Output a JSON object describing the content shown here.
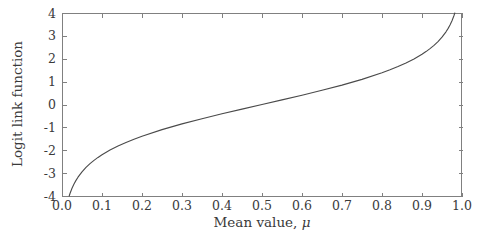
{
  "chart_data": {
    "type": "line",
    "title": "",
    "subtitle": "",
    "xlabel": "Mean value, μ",
    "xlabel_text": "Mean value,",
    "xlabel_symbol": "μ",
    "ylabel": "Logit link function",
    "xlim": [
      0.0,
      1.0
    ],
    "ylim": [
      -4,
      4
    ],
    "grid": false,
    "legend": null,
    "legend_position": "none",
    "annotations": [],
    "line_color": "#4a4a4a",
    "frame_color": "#808080",
    "background_color": "#ffffff",
    "xticks": [
      0.0,
      0.1,
      0.2,
      0.3,
      0.4,
      0.5,
      0.6,
      0.7,
      0.8,
      0.9,
      1.0
    ],
    "xticklabels": [
      "0.0",
      "0.1",
      "0.2",
      "0.3",
      "0.4",
      "0.5",
      "0.6",
      "0.7",
      "0.8",
      "0.9",
      "1.0"
    ],
    "yticks": [
      4,
      3,
      2,
      1,
      0,
      -1,
      -2,
      -3,
      -4
    ],
    "yticklabels": [
      "4",
      "3",
      "2",
      "1",
      "0",
      "-1",
      "-2",
      "-3",
      "-4"
    ],
    "function": "logit(mu) = ln(mu / (1 - mu))",
    "series": [
      {
        "name": "Logit link function",
        "x": [
          0.018,
          0.02,
          0.025,
          0.03,
          0.035,
          0.04,
          0.05,
          0.06,
          0.07,
          0.08,
          0.09,
          0.1,
          0.12,
          0.14,
          0.16,
          0.18,
          0.2,
          0.25,
          0.3,
          0.35,
          0.4,
          0.45,
          0.5,
          0.55,
          0.6,
          0.65,
          0.7,
          0.75,
          0.8,
          0.82,
          0.84,
          0.86,
          0.88,
          0.9,
          0.91,
          0.92,
          0.93,
          0.94,
          0.95,
          0.96,
          0.965,
          0.97,
          0.975,
          0.98,
          0.982
        ],
        "y": [
          -4.0,
          -3.892,
          -3.664,
          -3.476,
          -3.317,
          -3.178,
          -2.944,
          -2.752,
          -2.586,
          -2.442,
          -2.314,
          -2.197,
          -1.992,
          -1.815,
          -1.658,
          -1.516,
          -1.386,
          -1.099,
          -0.847,
          -0.619,
          -0.405,
          -0.201,
          0.0,
          0.201,
          0.405,
          0.619,
          0.847,
          1.099,
          1.386,
          1.516,
          1.658,
          1.815,
          1.992,
          2.197,
          2.314,
          2.442,
          2.586,
          2.752,
          2.944,
          3.178,
          3.317,
          3.476,
          3.664,
          3.892,
          4.0
        ]
      }
    ]
  },
  "figure": {
    "plot_area": {
      "left": 62,
      "top": 13,
      "right": 462,
      "bottom": 196
    }
  }
}
